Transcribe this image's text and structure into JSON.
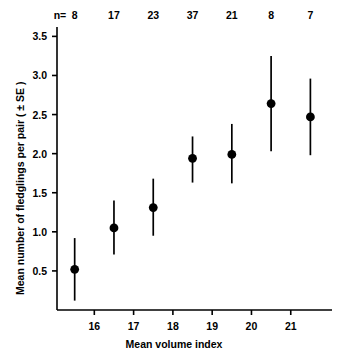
{
  "chart_data": {
    "type": "scatter",
    "title": "",
    "xlabel": "Mean volume index",
    "ylabel": "Mean number of fledglings per pair ( ± SE )",
    "xlim": [
      15.05,
      22.05
    ],
    "ylim": [
      0.0,
      3.62
    ],
    "grid": false,
    "legend": null,
    "x_ticks": [
      16,
      17,
      18,
      19,
      20,
      21
    ],
    "x_tick_labels": [
      "16",
      "17",
      "18",
      "19",
      "20",
      "21"
    ],
    "y_ticks": [
      0.5,
      1.0,
      1.5,
      2.0,
      2.5,
      3.0,
      3.5
    ],
    "y_tick_labels": [
      "0.5",
      "1.0",
      "1.5",
      "2.0",
      "2.5",
      "3.0",
      "3.5"
    ],
    "sample_size_prefix": "n=",
    "series": [
      {
        "name": "Mean fledglings per pair",
        "marker": "filled-circle",
        "color": "#000000",
        "error_type": "SE",
        "points": [
          {
            "x": 15.5,
            "y": 0.52,
            "y_low": 0.12,
            "y_high": 0.92,
            "n": "8"
          },
          {
            "x": 16.5,
            "y": 1.05,
            "y_low": 0.71,
            "y_high": 1.4,
            "n": "17"
          },
          {
            "x": 17.5,
            "y": 1.31,
            "y_low": 0.95,
            "y_high": 1.68,
            "n": "23"
          },
          {
            "x": 18.5,
            "y": 1.94,
            "y_low": 1.63,
            "y_high": 2.22,
            "n": "37"
          },
          {
            "x": 19.5,
            "y": 1.99,
            "y_low": 1.62,
            "y_high": 2.38,
            "n": "21"
          },
          {
            "x": 20.5,
            "y": 2.64,
            "y_low": 2.03,
            "y_high": 3.25,
            "n": "8"
          },
          {
            "x": 21.5,
            "y": 2.47,
            "y_low": 1.98,
            "y_high": 2.96,
            "n": "7"
          }
        ]
      }
    ]
  }
}
